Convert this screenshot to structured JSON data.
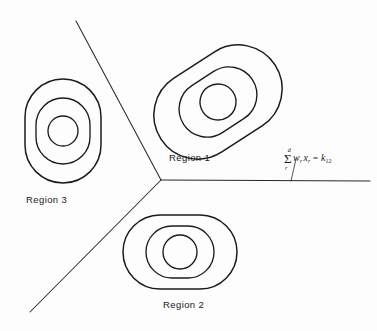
{
  "figure": {
    "type": "decision-region-diagram",
    "background_color": "#fdfdfd",
    "stroke_color": "#1b1b1b",
    "labels": {
      "region_1": "Region 1",
      "region_2": "Region 2",
      "region_3": "Region 3"
    },
    "annotation": {
      "summation_upper_limit": "d",
      "summation_symbol": "Σ",
      "summation_lower_index": "r",
      "weight_term": "w",
      "weight_subscript": "r",
      "variable_term": "x",
      "variable_subscript": "r",
      "equals": "=",
      "constant_term": "k",
      "constant_subscript": "12",
      "full_text": "Σ wᵣ xᵣ = k₁₂"
    },
    "boundaries": {
      "junction": {
        "x": 161,
        "y": 180
      },
      "upper_left_endpoint": {
        "x": 76,
        "y": 21
      },
      "lower_left_endpoint": {
        "x": 30,
        "y": 312
      },
      "right_endpoint": {
        "x": 370,
        "y": 181
      },
      "leader_line": {
        "from_x": 296,
        "from_y": 159,
        "to_x": 291,
        "to_y": 181
      }
    },
    "clusters": [
      {
        "name": "region-1-contours",
        "center": {
          "x": 218,
          "y": 102
        },
        "rotation_deg": -33,
        "rings": [
          {
            "rx": 68,
            "ry": 44,
            "corner": 44
          },
          {
            "rx": 41,
            "ry": 28,
            "corner": 28
          },
          {
            "rx": 18,
            "ry": 18,
            "corner": 18
          }
        ]
      },
      {
        "name": "region-2-contours",
        "center": {
          "x": 180,
          "y": 252
        },
        "rotation_deg": 0,
        "rings": [
          {
            "rx": 57,
            "ry": 37,
            "corner": 37
          },
          {
            "rx": 34,
            "ry": 26,
            "corner": 26
          },
          {
            "rx": 17,
            "ry": 17,
            "corner": 17
          }
        ]
      },
      {
        "name": "region-3-contours",
        "center": {
          "x": 63,
          "y": 131
        },
        "rotation_deg": 0,
        "rings": [
          {
            "rx": 38,
            "ry": 52,
            "corner": 38
          },
          {
            "rx": 27,
            "ry": 33,
            "corner": 27
          },
          {
            "rx": 15,
            "ry": 15,
            "corner": 15
          }
        ]
      }
    ]
  }
}
